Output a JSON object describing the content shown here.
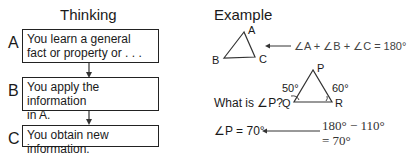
{
  "thinking": {
    "title": "Thinking",
    "steps": [
      {
        "letter": "A",
        "text_line1": "You learn a general",
        "text_line2": "fact or property or . . ."
      },
      {
        "letter": "B",
        "text_line1": "You apply the information",
        "text_line2": "in A."
      },
      {
        "letter": "C",
        "text_line1": "You obtain new information."
      }
    ]
  },
  "example": {
    "title": "Example",
    "triangle1": {
      "vertices": [
        "A",
        "B",
        "C"
      ],
      "equation": "∠A + ∠B + ∠C = 180°"
    },
    "triangle2": {
      "vertices": [
        "P",
        "Q",
        "R"
      ],
      "angle_q": "50°",
      "angle_r": "60°"
    },
    "question": "What is ∠P?",
    "answer": "∠P = 70°",
    "calc_line1": "180° − 110°",
    "calc_line2": "= 70°"
  }
}
